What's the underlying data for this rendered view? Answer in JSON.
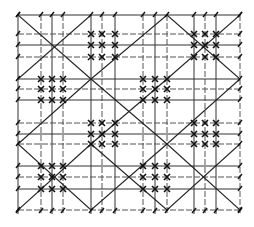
{
  "diagram": {
    "title": "",
    "stroke_color": "#222222",
    "background": "#ffffff",
    "grid_columns": 14,
    "grid_rows": 14,
    "mark_cluster_blocks": [
      {
        "col_block": 1,
        "row_block": 0
      },
      {
        "col_block": 3,
        "row_block": 0
      },
      {
        "col_block": 0,
        "row_block": 1
      },
      {
        "col_block": 2,
        "row_block": 1
      },
      {
        "col_block": 1,
        "row_block": 2
      },
      {
        "col_block": 3,
        "row_block": 2
      },
      {
        "col_block": 0,
        "row_block": 3
      },
      {
        "col_block": 2,
        "row_block": 3
      }
    ]
  }
}
